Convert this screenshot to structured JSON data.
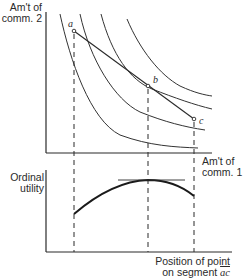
{
  "upper_panel": {
    "y_axis_label_line1": "Am't of",
    "y_axis_label_line2": "comm. 2",
    "x_axis_label_line1": "Am't of",
    "x_axis_label_line2": "comm. 1",
    "points": [
      {
        "label": "a"
      },
      {
        "label": "b"
      },
      {
        "label": "c"
      }
    ],
    "indifference_curve_count": 4
  },
  "lower_panel": {
    "y_axis_label_line1": "Ordinal",
    "y_axis_label_line2": "utility",
    "x_axis_label_line1": "Position of point",
    "x_axis_label_line2_prefix": "on segment",
    "x_axis_label_segment": "ac"
  },
  "colors": {
    "ink": "#2a2a2a",
    "background": "#ffffff"
  }
}
